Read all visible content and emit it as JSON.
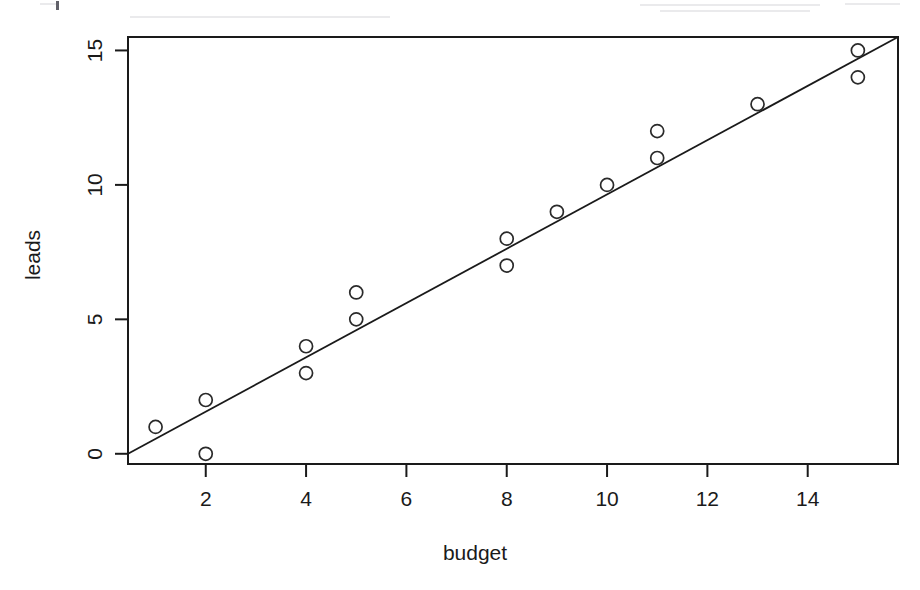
{
  "chart_data": {
    "type": "scatter",
    "title": "",
    "xlabel": "budget",
    "ylabel": "leads",
    "x": [
      1,
      2,
      2,
      4,
      4,
      5,
      5,
      8,
      8,
      9,
      10,
      11,
      11,
      13,
      15,
      15
    ],
    "y": [
      1,
      2,
      0,
      4,
      3,
      6,
      5,
      8,
      7,
      9,
      10,
      12,
      11,
      13,
      15,
      14
    ],
    "points": [
      {
        "x": 1,
        "y": 1
      },
      {
        "x": 2,
        "y": 2
      },
      {
        "x": 2,
        "y": 0
      },
      {
        "x": 4,
        "y": 4
      },
      {
        "x": 4,
        "y": 3
      },
      {
        "x": 5,
        "y": 6
      },
      {
        "x": 5,
        "y": 5
      },
      {
        "x": 8,
        "y": 8
      },
      {
        "x": 8,
        "y": 7
      },
      {
        "x": 9,
        "y": 9
      },
      {
        "x": 10,
        "y": 10
      },
      {
        "x": 11,
        "y": 12
      },
      {
        "x": 11,
        "y": 11
      },
      {
        "x": 13,
        "y": 13
      },
      {
        "x": 15,
        "y": 15
      },
      {
        "x": 15,
        "y": 14
      }
    ],
    "series": [
      {
        "name": "observations",
        "type": "scatter",
        "marker": "open-circle",
        "values": [
          1,
          2,
          0,
          4,
          3,
          6,
          5,
          8,
          7,
          9,
          10,
          12,
          11,
          13,
          15,
          14
        ]
      },
      {
        "name": "regression-line",
        "type": "line",
        "endpoints": [
          {
            "x": 0.45,
            "y": 0.0
          },
          {
            "x": 15.8,
            "y": 15.5
          }
        ],
        "slope": 1.01,
        "intercept": -0.45
      }
    ],
    "xticks": [
      2,
      4,
      6,
      8,
      10,
      12,
      14
    ],
    "yticks": [
      0,
      5,
      10,
      15
    ],
    "xlim": [
      0.45,
      15.8
    ],
    "ylim": [
      -0.38,
      15.5
    ],
    "grid": false,
    "legend": null,
    "legend_position": "none",
    "colors": {
      "axis": "#1a1a1a",
      "marker": "#2a2a2a",
      "line": "#1a1a1a",
      "background": "#ffffff"
    }
  },
  "axes": {
    "x_label": "budget",
    "y_label": "leads",
    "x_tick_labels": [
      "2",
      "4",
      "6",
      "8",
      "10",
      "12",
      "14"
    ],
    "y_tick_labels": [
      "0",
      "5",
      "10",
      "15"
    ]
  }
}
